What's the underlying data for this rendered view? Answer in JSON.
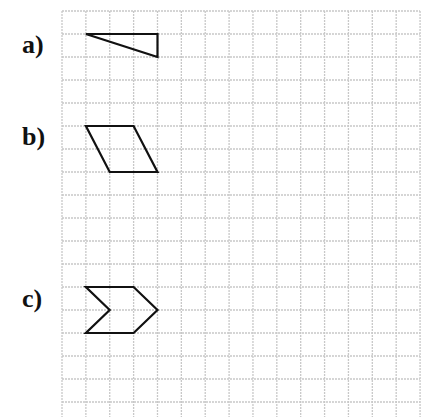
{
  "grid": {
    "origin_x": 62,
    "origin_y": 11,
    "cell_w": 23.87,
    "cell_h": 23,
    "cols": 15,
    "rows": 18,
    "line_color": "#c8c8c8",
    "shape_color": "#111111"
  },
  "figures": [
    {
      "label": "a)",
      "label_pos": {
        "x": 22,
        "y": 32
      },
      "shape": "triangle",
      "points_grid": [
        [
          1,
          1
        ],
        [
          4,
          1
        ],
        [
          4,
          2
        ]
      ]
    },
    {
      "label": "b)",
      "label_pos": {
        "x": 22,
        "y": 124
      },
      "shape": "parallelogram",
      "points_grid": [
        [
          1,
          5
        ],
        [
          3,
          5
        ],
        [
          4,
          7
        ],
        [
          2,
          7
        ]
      ]
    },
    {
      "label": "c)",
      "label_pos": {
        "x": 22,
        "y": 286
      },
      "shape": "chevron",
      "points_grid": [
        [
          1,
          12
        ],
        [
          3,
          12
        ],
        [
          4,
          13
        ],
        [
          3,
          14
        ],
        [
          1,
          14
        ],
        [
          2,
          13
        ]
      ]
    }
  ]
}
